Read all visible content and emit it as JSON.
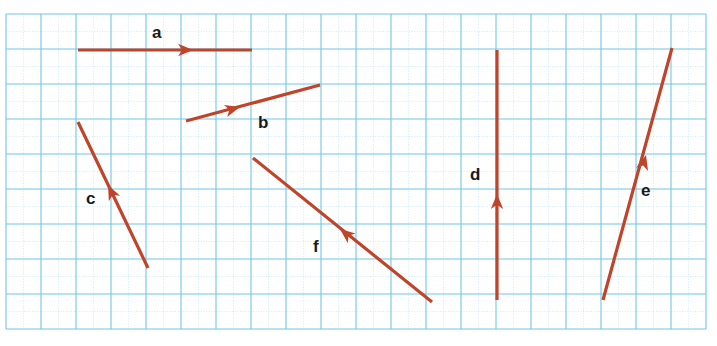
{
  "figure": {
    "title": "",
    "background_color": "#ffffff",
    "width": 717,
    "height": 346
  },
  "grid": {
    "line_color": "#6ec6e8",
    "minor_line_color": "#a9dcf2",
    "origin_x": 6,
    "origin_y": 14,
    "cell_size": 35,
    "columns": 20,
    "rows": 9,
    "right": 706,
    "bottom": 329
  },
  "chart_data": {
    "type": "scatter",
    "title": "",
    "xlabel": "",
    "ylabel": "",
    "subtitle": "",
    "grid": true,
    "legend_position": "none",
    "vector_color": "#c0442a",
    "label_color": "#1a1a1a",
    "cell_size": 35,
    "vectors": [
      {
        "name": "a",
        "label": "a",
        "tail": [
          78,
          50
        ],
        "head": [
          252,
          50
        ],
        "arrow_at": [
          193,
          50
        ],
        "label_pos": [
          152,
          24
        ],
        "components_cells": [
          5,
          0
        ],
        "direction": "right"
      },
      {
        "name": "b",
        "label": "b",
        "tail": [
          186,
          121
        ],
        "head": [
          320,
          85
        ],
        "arrow_at": [
          240,
          107
        ],
        "label_pos": [
          258,
          114
        ],
        "components_cells": [
          4,
          1
        ],
        "direction": "up-right"
      },
      {
        "name": "c",
        "label": "c",
        "tail": [
          148,
          268
        ],
        "head": [
          78,
          122
        ],
        "arrow_at": [
          108,
          185
        ],
        "label_pos": [
          86,
          190
        ],
        "components_cells": [
          -2,
          4
        ],
        "direction": "up-left"
      },
      {
        "name": "d",
        "label": "d",
        "tail": [
          497,
          300
        ],
        "head": [
          497,
          50
        ],
        "arrow_at": [
          497,
          194
        ],
        "label_pos": [
          470,
          166
        ],
        "components_cells": [
          0,
          7
        ],
        "direction": "up"
      },
      {
        "name": "e",
        "label": "e",
        "tail": [
          603,
          300
        ],
        "head": [
          672,
          48
        ],
        "arrow_at": [
          646,
          155
        ],
        "label_pos": [
          641,
          182
        ],
        "components_cells": [
          2,
          7
        ],
        "direction": "up-right"
      },
      {
        "name": "f",
        "label": "f",
        "tail": [
          432,
          302
        ],
        "head": [
          253,
          158
        ],
        "arrow_at": [
          340,
          229
        ],
        "label_pos": [
          313,
          238
        ],
        "components_cells": [
          -5,
          4
        ],
        "direction": "up-left"
      }
    ]
  }
}
